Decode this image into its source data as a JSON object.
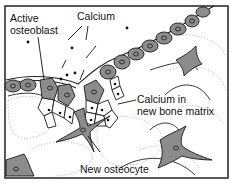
{
  "figure": {
    "labels": {
      "active_osteoblast_line1": "Active",
      "active_osteoblast_line2": "osteoblast",
      "calcium": "Calcium",
      "calcium_matrix_line1": "Calcium in",
      "calcium_matrix_line2": "new bone matrix",
      "new_osteocyte": "New osteocyte"
    },
    "colors": {
      "cell_fill": "#8c8c8c",
      "outline": "#1a1a1a",
      "matrix": "#ffffff",
      "stipple": "#9a9a9a"
    }
  }
}
